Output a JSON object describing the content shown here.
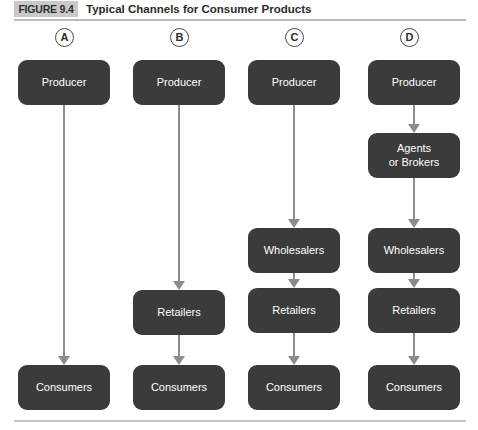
{
  "figure": {
    "badge": "FIGURE 9.4",
    "title": "Typical Channels for Consumer Products"
  },
  "colors": {
    "node_fill": "#3b3b3b",
    "node_text": "#ffffff",
    "arrow": "#8c8c8c",
    "badge_fill": "#c9c9c9",
    "rule": "#b9b9b9",
    "background": "#ffffff"
  },
  "columns": [
    {
      "letter": "A",
      "nodes": [
        "Producer",
        "Consumers"
      ]
    },
    {
      "letter": "B",
      "nodes": [
        "Producer",
        "Retailers",
        "Consumers"
      ]
    },
    {
      "letter": "C",
      "nodes": [
        "Producer",
        "Wholesalers",
        "Retailers",
        "Consumers"
      ]
    },
    {
      "letter": "D",
      "nodes": [
        "Producer",
        "Agents\nor Brokers",
        "Wholesalers",
        "Retailers",
        "Consumers"
      ]
    }
  ]
}
